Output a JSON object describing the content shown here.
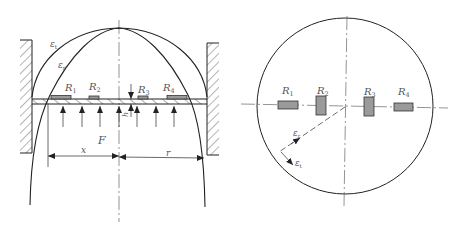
{
  "figure": {
    "side_view": {
      "strain_curves": [
        {
          "id": "tangential",
          "label": "ε",
          "subscript": "t"
        },
        {
          "id": "radial",
          "label": "ε",
          "subscript": "r"
        }
      ],
      "gauges": [
        {
          "label": "R",
          "subscript": "1"
        },
        {
          "label": "R",
          "subscript": "2"
        },
        {
          "label": "R",
          "subscript": "3"
        },
        {
          "label": "R",
          "subscript": "4"
        }
      ],
      "thickness_label": "h",
      "force_label": "F",
      "dimension_x_label": "x",
      "dimension_r_label": "r"
    },
    "top_view": {
      "gauges": [
        {
          "label": "R",
          "subscript": "1"
        },
        {
          "label": "R",
          "subscript": "2"
        },
        {
          "label": "R",
          "subscript": "3"
        },
        {
          "label": "R",
          "subscript": "4"
        }
      ],
      "radial_strain": {
        "label": "ε",
        "subscript": "r"
      },
      "tangential_strain": {
        "label": "ε",
        "subscript": "t"
      }
    }
  },
  "colors": {
    "line": "#222222",
    "gauge_fill": "#9a9a9a",
    "label": "#555555"
  }
}
